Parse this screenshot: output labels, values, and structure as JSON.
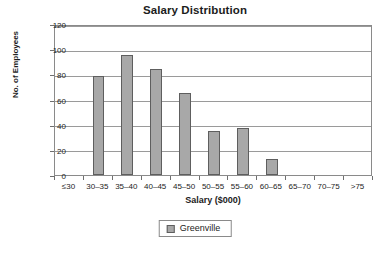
{
  "chart_data": {
    "type": "bar",
    "title": "Salary Distribution",
    "xlabel": "Salary ($000)",
    "ylabel": "No. of Employees",
    "categories": [
      "≤30",
      "30–35",
      "35–40",
      "40–45",
      "45–50",
      "50–55",
      "55–60",
      "60–65",
      "65–70",
      "70–75",
      ">75"
    ],
    "values": [
      0,
      79,
      95,
      84,
      65,
      35,
      37,
      13,
      0,
      0,
      0
    ],
    "series": [
      {
        "name": "Greenville",
        "values": [
          0,
          79,
          95,
          84,
          65,
          35,
          37,
          13,
          0,
          0,
          0
        ]
      }
    ],
    "ylim": [
      0,
      120
    ],
    "yticks": [
      0,
      20,
      40,
      60,
      80,
      100,
      120
    ],
    "ytick_labels": [
      "0",
      "20",
      "40",
      "60",
      "80",
      "100",
      "120"
    ],
    "grid": true,
    "grid_axis": "y",
    "legend": [
      "Greenville"
    ],
    "legend_position": "bottom",
    "bar_color": "#a8a8a8",
    "bar_border_color": "#5e5e5e",
    "grid_color": "#9a9a9a",
    "axis_color": "#8a8a8a",
    "text_color": "#1c1c1c"
  }
}
